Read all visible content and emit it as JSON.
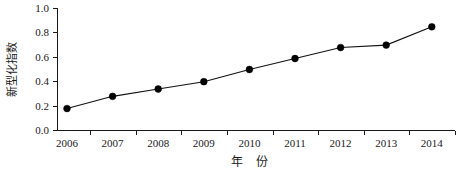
{
  "chart_data": {
    "type": "line",
    "title": "",
    "xlabel": "年  份",
    "ylabel": "新型化指数",
    "categories": [
      "2006",
      "2007",
      "2008",
      "2009",
      "2010",
      "2011",
      "2012",
      "2013",
      "2014"
    ],
    "x": [
      2006,
      2007,
      2008,
      2009,
      2010,
      2011,
      2012,
      2013,
      2014
    ],
    "values": [
      0.18,
      0.28,
      0.34,
      0.4,
      0.5,
      0.59,
      0.68,
      0.7,
      0.85
    ],
    "series": [
      {
        "name": "新型化指数",
        "values": [
          0.18,
          0.28,
          0.34,
          0.4,
          0.5,
          0.59,
          0.68,
          0.7,
          0.85
        ]
      }
    ],
    "ylim": [
      0.0,
      1.0
    ],
    "yticks": [
      "0.0",
      "0.2",
      "0.4",
      "0.6",
      "0.8",
      "1.0"
    ],
    "ytick_values": [
      0.0,
      0.2,
      0.4,
      0.6,
      0.8,
      1.0
    ],
    "xticks": [
      "2006",
      "2007",
      "2008",
      "2009",
      "2010",
      "2011",
      "2012",
      "2013",
      "2014"
    ],
    "grid": false,
    "legend": false,
    "legend_position": "none",
    "marker": "filled-circle",
    "line_color": "#111111",
    "marker_color": "#000000",
    "axis_color": "#1a1a1a",
    "background_color": "#ffffff"
  }
}
